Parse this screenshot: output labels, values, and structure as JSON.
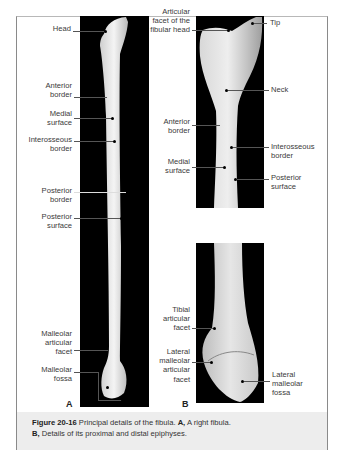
{
  "figure": {
    "number": "Figure 20-16",
    "caption_main": " Principal details of the fibula. ",
    "caption_a_label": "A,",
    "caption_a_text": " A right fibula.",
    "caption_b_label": "B,",
    "caption_b_text": " Details of its proximal and distal epiphyses."
  },
  "panel_a": {
    "letter": "A",
    "labels": {
      "head": "Head",
      "anterior_border": "Anterior border",
      "medial_surface": "Medial surface",
      "interosseous_border": "Interosseous border",
      "posterior_border": "Posterior border",
      "posterior_surface": "Posterior surface",
      "malleolar_articular_facet": "Malleolar articular facet",
      "malleolar_fossa": "Malleolar fossa"
    }
  },
  "panel_b": {
    "letter": "B",
    "labels": {
      "articular_facet": "Articular facet of the fibular head",
      "tip": "Tip",
      "neck": "Neck",
      "anterior_border": "Anterior border",
      "interosseous_border": "Interosseous border",
      "medial_surface": "Medial surface",
      "posterior_surface": "Posterior surface",
      "tibial_articular_facet": "Tibial articular facet",
      "lateral_malleolar_articular_facet": "Lateral malleolar articular facet",
      "lateral_malleolar_fossa": "Lateral malleolar fossa"
    }
  }
}
